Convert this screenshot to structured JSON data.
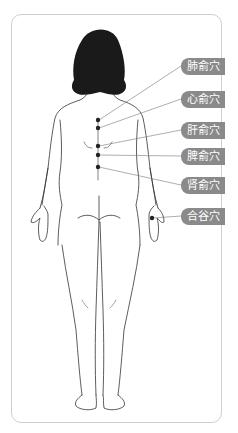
{
  "diagram": {
    "type": "acupoint-body-chart",
    "view": "back",
    "accent_color": "#8a8a8a",
    "point_color": "#222222",
    "points": [
      {
        "id": "feishu",
        "label": "肺俞穴",
        "x": 98,
        "y": 120,
        "label_y": 58
      },
      {
        "id": "xinshu",
        "label": "心俞穴",
        "x": 98,
        "y": 128,
        "label_y": 91
      },
      {
        "id": "ganshu",
        "label": "肝俞穴",
        "x": 98,
        "y": 146,
        "label_y": 122
      },
      {
        "id": "pishu",
        "label": "脾俞穴",
        "x": 98,
        "y": 155,
        "label_y": 148
      },
      {
        "id": "shenshu",
        "label": "肾俞穴",
        "x": 98,
        "y": 167,
        "label_y": 177
      },
      {
        "id": "hegu",
        "label": "合谷穴",
        "x": 152,
        "y": 218,
        "label_y": 208
      }
    ]
  }
}
